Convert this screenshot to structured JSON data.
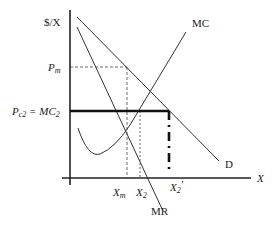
{
  "diagram": {
    "axes": {
      "y_label": "$/X",
      "x_label": "X"
    },
    "curves": {
      "demand": "D",
      "marginal_revenue": "MR",
      "marginal_cost": "MC"
    },
    "price_labels": {
      "monopoly_price": {
        "main": "P",
        "sub": "m"
      },
      "cap_price": {
        "main": "P",
        "sub": "c2",
        "eq": " = MC",
        "eq_sub": "2"
      }
    },
    "quantity_labels": {
      "monopoly_qty": {
        "main": "X",
        "sub": "m"
      },
      "cap_qty": {
        "main": "X",
        "sub": "2"
      },
      "demand_at_cap": {
        "main": "X",
        "sub": "2",
        "prime": "′"
      }
    },
    "colors": {
      "line": "#222222",
      "background": "#ffffff"
    }
  }
}
